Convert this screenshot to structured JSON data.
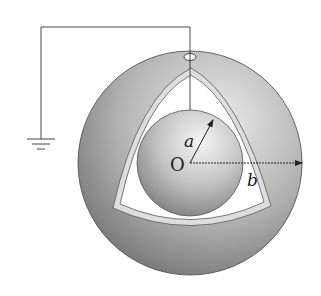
{
  "diagram": {
    "labels": {
      "center": "O",
      "inner_radius": "a",
      "outer_radius": "b"
    },
    "components": {
      "outer_sphere": {
        "name": "outer conducting shell",
        "radius_symbol": "b"
      },
      "inner_sphere": {
        "name": "inner sphere",
        "radius_symbol": "a"
      },
      "cavity": {
        "shape": "curved triangle"
      },
      "ground_wire": {
        "connects": "inner sphere to ground",
        "passes_through": "small hole in outer shell"
      },
      "ground_symbol": {
        "name": "earth ground"
      }
    },
    "colors": {
      "outer_dark": "#6f6f6f",
      "outer_light": "#e4e4e4",
      "inner_dark": "#7a7a7a",
      "inner_light": "#f2f2f2",
      "cavity_fill": "#ffffff",
      "rim_fill": "#dcdcdc",
      "line": "#333333"
    }
  }
}
